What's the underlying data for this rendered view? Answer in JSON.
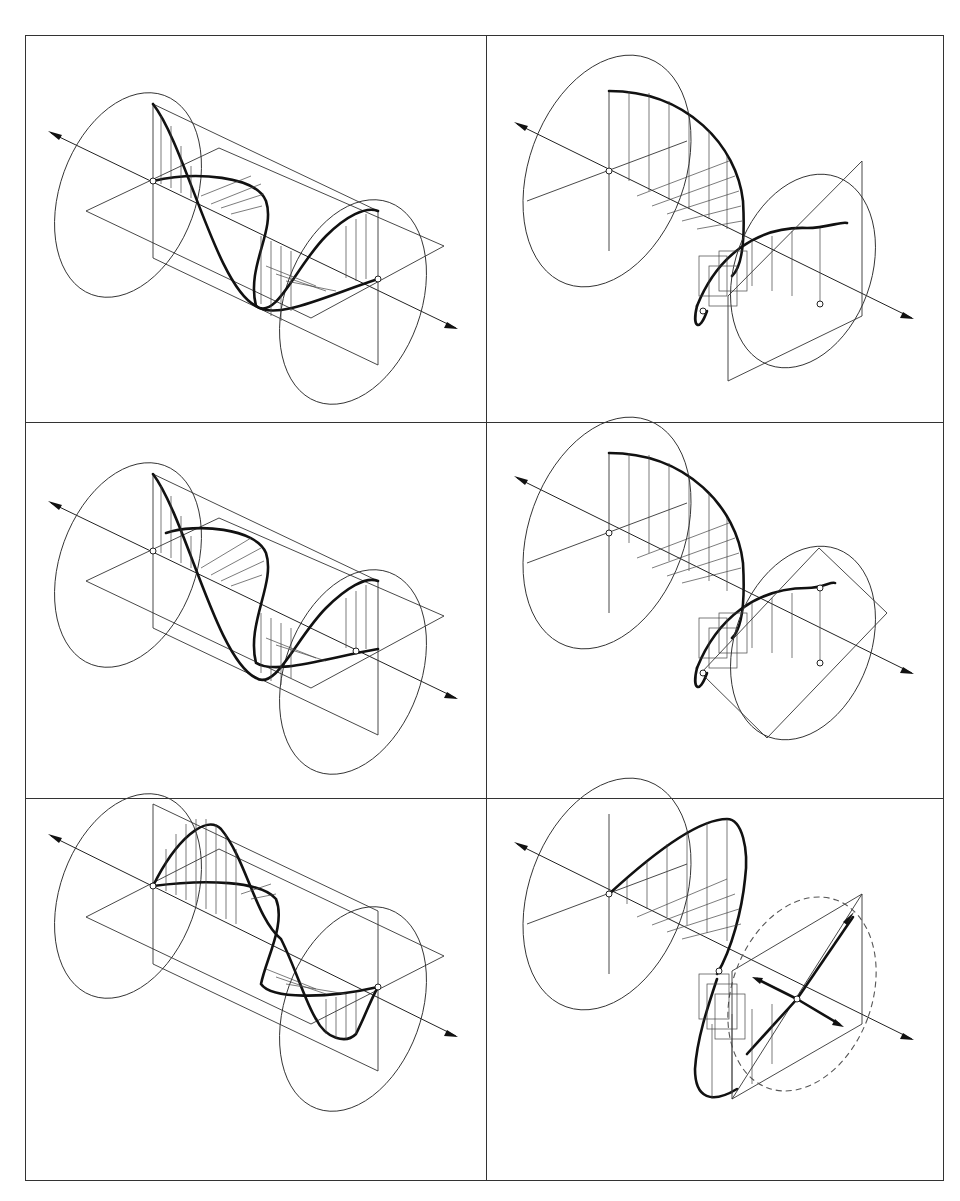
{
  "figure": {
    "layout": "2 columns x 3 rows grid of line drawings",
    "colors": {
      "background": "#ffffff",
      "ink": "#222222"
    },
    "panels": [
      {
        "id": "top-left",
        "depicts": "linearly polarized wave in cylinder, vertical + horizontal components in phase"
      },
      {
        "id": "top-right",
        "depicts": "circular polarization helix with square observation plane"
      },
      {
        "id": "middle-left",
        "depicts": "linearly polarized wave in cylinder, phase-shifted components"
      },
      {
        "id": "middle-right",
        "depicts": "elliptical polarization helix with tilted observation plane"
      },
      {
        "id": "bottom-left",
        "depicts": "linearly polarized wave in cylinder, opposite phase"
      },
      {
        "id": "bottom-right",
        "depicts": "polarization with diagonal vectors on dashed ellipse in observation plane"
      }
    ]
  }
}
